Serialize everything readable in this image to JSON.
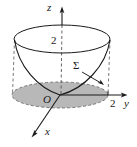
{
  "figure": {
    "background_color": "#ffffff",
    "stroke_color": "#1a1a1a",
    "disk_fill_color": "#b8b8b8",
    "labels": {
      "z_axis": "z",
      "y_axis": "y",
      "x_axis": "x",
      "origin": "O",
      "surface": "Σ",
      "z_tick": "2",
      "y_tick": "2"
    },
    "icons": {
      "z_arrow": "arrow-up-icon",
      "y_arrow": "arrow-right-icon",
      "x_arrow": "arrow-down-left-icon",
      "sigma_pointer": "leader-arrow-icon"
    },
    "geometry": {
      "top_ellipse": {
        "cx": 62,
        "cy": 39,
        "rx": 48,
        "ry": 14
      },
      "base_ellipse": {
        "cx": 60,
        "cy": 95,
        "rx": 48,
        "ry": 13
      },
      "origin": {
        "x": 60,
        "y": 95
      },
      "z_axis_top": {
        "x": 62,
        "y": 8
      },
      "y_axis_end": {
        "x": 125,
        "y": 95
      },
      "x_axis_end": {
        "x": 32,
        "y": 136
      }
    }
  }
}
